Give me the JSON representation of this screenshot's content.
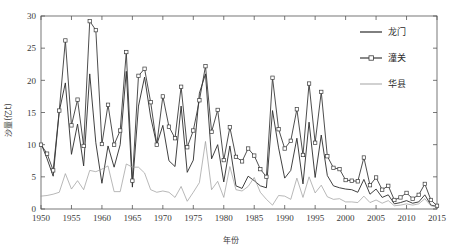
{
  "chart_data": {
    "type": "line",
    "title": "",
    "xlabel": "年份",
    "ylabel": "沙量(亿t)",
    "xlim": [
      1950,
      2015
    ],
    "ylim": [
      0,
      30
    ],
    "xticks": [
      1950,
      1955,
      1960,
      1965,
      1970,
      1975,
      1980,
      1985,
      1990,
      1995,
      2000,
      2005,
      2010,
      2015
    ],
    "yticks": [
      0,
      5,
      10,
      15,
      20,
      25,
      30
    ],
    "grid": false,
    "legend_position": "top-right",
    "x": [
      1950,
      1951,
      1952,
      1953,
      1954,
      1955,
      1956,
      1957,
      1958,
      1959,
      1960,
      1961,
      1962,
      1963,
      1964,
      1965,
      1966,
      1967,
      1968,
      1969,
      1970,
      1971,
      1972,
      1973,
      1974,
      1975,
      1976,
      1977,
      1978,
      1979,
      1980,
      1981,
      1982,
      1983,
      1984,
      1985,
      1986,
      1987,
      1988,
      1989,
      1990,
      1991,
      1992,
      1993,
      1994,
      1995,
      1996,
      1997,
      1998,
      1999,
      2000,
      2001,
      2002,
      2003,
      2004,
      2005,
      2006,
      2007,
      2008,
      2009,
      2010,
      2011,
      2012,
      2013,
      2014,
      2015
    ],
    "series": [
      {
        "name": "龙门",
        "color": "#2b2b2b",
        "marker": "none",
        "values": [
          10.2,
          7.8,
          5.1,
          15.2,
          19.6,
          8.5,
          13.2,
          6.7,
          21.0,
          10.3,
          4.0,
          9.8,
          6.5,
          10.0,
          21.4,
          3.4,
          16.0,
          20.5,
          14.3,
          10.0,
          13.0,
          7.5,
          6.6,
          16.0,
          5.7,
          7.6,
          18.0,
          21.0,
          7.8,
          10.0,
          4.2,
          9.8,
          3.6,
          3.2,
          5.1,
          4.4,
          3.6,
          3.3,
          15.3,
          9.5,
          4.8,
          6.0,
          11.0,
          3.9,
          13.5,
          4.9,
          11.5,
          5.2,
          3.6,
          3.3,
          3.1,
          3.0,
          2.6,
          4.6,
          2.3,
          3.1,
          1.8,
          2.2,
          0.8,
          1.0,
          1.3,
          0.9,
          1.1,
          2.2,
          0.6,
          0.4
        ]
      },
      {
        "name": "潼关",
        "color": "#3a3a3a",
        "marker": "square-open",
        "values": [
          10.0,
          8.6,
          6.0,
          15.3,
          26.2,
          13.0,
          17.0,
          9.8,
          29.2,
          27.8,
          10.1,
          16.2,
          10.0,
          12.2,
          24.4,
          4.4,
          20.7,
          21.8,
          16.6,
          10.0,
          17.5,
          12.8,
          11.0,
          19.0,
          9.6,
          12.2,
          16.9,
          22.2,
          12.0,
          15.4,
          7.6,
          12.7,
          8.1,
          7.4,
          9.4,
          8.3,
          6.2,
          5.0,
          20.4,
          12.4,
          9.4,
          10.6,
          15.5,
          8.4,
          19.5,
          10.3,
          18.2,
          8.2,
          6.4,
          6.2,
          4.5,
          4.4,
          4.3,
          8.0,
          3.7,
          4.9,
          3.0,
          3.6,
          1.4,
          1.8,
          2.5,
          1.6,
          2.2,
          3.9,
          1.4,
          0.5
        ]
      },
      {
        "name": "华县",
        "color": "#999999",
        "marker": "none",
        "values": [
          2.0,
          2.1,
          2.3,
          2.6,
          5.5,
          3.1,
          4.4,
          3.0,
          6.0,
          5.8,
          6.2,
          6.7,
          2.7,
          2.7,
          7.0,
          6.5,
          6.5,
          5.6,
          3.0,
          2.6,
          2.8,
          2.6,
          1.8,
          3.5,
          1.2,
          2.6,
          4.1,
          10.5,
          3.0,
          4.3,
          1.8,
          6.6,
          3.0,
          2.8,
          3.5,
          4.9,
          2.6,
          1.5,
          0.6,
          2.1,
          2.0,
          1.5,
          4.8,
          1.8,
          5.0,
          2.5,
          3.7,
          1.9,
          1.5,
          1.6,
          1.1,
          1.1,
          1.0,
          2.0,
          1.0,
          1.4,
          0.9,
          1.3,
          0.5,
          0.6,
          0.8,
          0.6,
          0.8,
          1.6,
          0.5,
          0.3
        ]
      }
    ]
  },
  "legend": {
    "items": [
      {
        "label": "龙门"
      },
      {
        "label": "潼关"
      },
      {
        "label": "华县"
      }
    ]
  },
  "axes": {
    "x_title": "年份",
    "y_title": "沙量(亿t)",
    "x_tick_labels": [
      "1950",
      "1955",
      "1960",
      "1965",
      "1970",
      "1975",
      "1980",
      "1985",
      "1990",
      "1995",
      "2000",
      "2005",
      "2010",
      "2015"
    ],
    "y_tick_labels": [
      "0",
      "5",
      "10",
      "15",
      "20",
      "25",
      "30"
    ]
  }
}
